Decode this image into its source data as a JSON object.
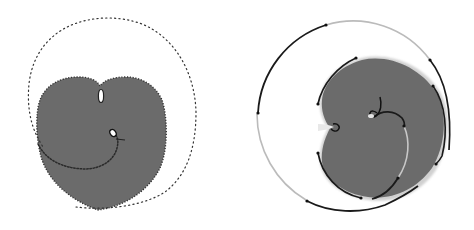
{
  "figure": {
    "colors": {
      "background": "#ffffff",
      "fill": "#6b6b6b",
      "dark_curve": "#1a1a1a",
      "light_curve": "#b8b8b8",
      "dotted_curve": "#333333"
    },
    "panels": [
      {
        "id": "left",
        "name": "heart-shape-with-dotted-spiral",
        "elements": [
          "outer dotted spiral",
          "gray heart-shaped region",
          "top cusp loop",
          "inner dotted spiral with small loop"
        ]
      },
      {
        "id": "right",
        "name": "rotated-cardioid-with-segmented-circle",
        "elements": [
          "outer circle with alternating dark/light arcs",
          "gray cardioid region",
          "left cusp loop",
          "inner spiral arcs",
          "center hook loop"
        ]
      }
    ]
  }
}
